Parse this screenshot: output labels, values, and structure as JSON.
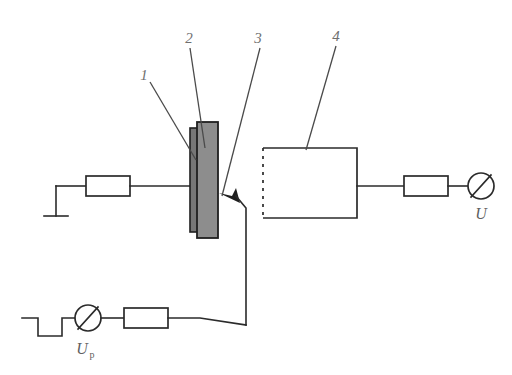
{
  "figure": {
    "background_color": "#ffffff",
    "line_color": "#2b2b2b",
    "layer_fill_color": "#8d8d8d",
    "sublayer_fill_color": "#767676"
  },
  "callouts": [
    {
      "id": "1",
      "label": "1"
    },
    {
      "id": "2",
      "label": "2"
    },
    {
      "id": "3",
      "label": "3"
    },
    {
      "id": "4",
      "label": "4"
    }
  ],
  "signals": {
    "output_voltage": {
      "symbol": "U",
      "subscript": ""
    },
    "pulse_voltage": {
      "symbol": "U",
      "subscript": "p"
    }
  },
  "components": {
    "ground": {
      "name": "ground-symbol"
    },
    "resistor_left": {
      "name": "resistor"
    },
    "resistor_right": {
      "name": "resistor"
    },
    "resistor_pulse": {
      "name": "resistor"
    },
    "meter_right": {
      "name": "voltmeter"
    },
    "meter_pulse": {
      "name": "voltmeter"
    },
    "pulse_source": {
      "name": "square-wave-generator"
    },
    "sample_stack": {
      "name": "layered-sample"
    },
    "detector_box": {
      "name": "dashed-enclosure"
    }
  }
}
